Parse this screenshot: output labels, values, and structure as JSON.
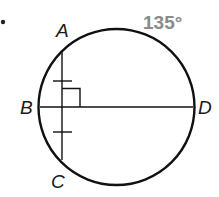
{
  "diagram": {
    "bullet": "•",
    "circle": {
      "cx": 116.5,
      "cy": 107,
      "r": 78
    },
    "points": {
      "A": {
        "label": "A",
        "x": 62,
        "y": 52
      },
      "B": {
        "label": "B",
        "x": 40,
        "y": 107
      },
      "C": {
        "label": "C",
        "x": 62,
        "y": 160
      },
      "D": {
        "label": "D",
        "x": 193,
        "y": 107
      }
    },
    "segments": [
      {
        "name": "chord-AC",
        "from": "A",
        "to": "C"
      },
      {
        "name": "diameter-BD",
        "from": "B",
        "to": "D"
      }
    ],
    "congruence_ticks": 2,
    "right_angle_marker": true,
    "arc_measure": {
      "label": "135°",
      "color": "#8a8a8a"
    },
    "colors": {
      "stroke": "#111111",
      "text": "#1a1a1a",
      "muted": "#8a8a8a"
    }
  }
}
